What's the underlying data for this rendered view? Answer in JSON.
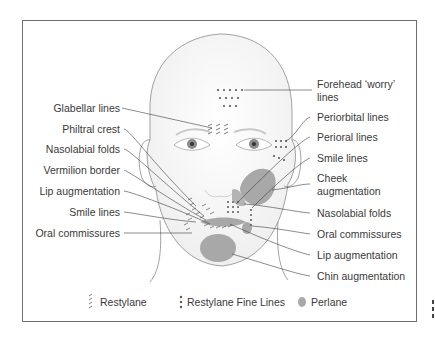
{
  "left_labels": [
    {
      "text": "Glabellar lines",
      "y": 102
    },
    {
      "text": "Philtral crest",
      "y": 123
    },
    {
      "text": "Nasolabial folds",
      "y": 143
    },
    {
      "text": "Vermilion border",
      "y": 164
    },
    {
      "text": "Lip augmentation",
      "y": 185
    },
    {
      "text": "Smile lines",
      "y": 206
    },
    {
      "text": "Oral commissures",
      "y": 227
    }
  ],
  "right_labels": [
    {
      "text": "Forehead ‘worry’",
      "y": 82
    },
    {
      "text": "lines",
      "y": 95
    },
    {
      "text": "Periorbital lines",
      "y": 111
    },
    {
      "text": "Perioral lines",
      "y": 131
    },
    {
      "text": "Smile lines",
      "y": 152
    },
    {
      "text": "Cheek",
      "y": 172
    },
    {
      "text": "augmentation",
      "y": 185
    },
    {
      "text": "Nasolabial folds",
      "y": 207
    },
    {
      "text": "Oral commissures",
      "y": 228
    },
    {
      "text": "Lip augmentation",
      "y": 249
    },
    {
      "text": "Chin augmentation",
      "y": 270
    }
  ],
  "legend": [
    {
      "symbol": "restylane-hatch-icon",
      "label": "Restylane"
    },
    {
      "symbol": "restylane-fine-dots-icon",
      "label": "Restylane Fine Lines"
    },
    {
      "symbol": "perlane-blob-icon",
      "label": "Perlane"
    }
  ],
  "colors": {
    "frame": "#6e6e6e",
    "face_outline": "#8a8a8a",
    "leader_line": "#3c3c3c",
    "text": "#3a3a3a",
    "perlane_fill": "#a8a8a8",
    "dots": "#5a5a5a"
  }
}
